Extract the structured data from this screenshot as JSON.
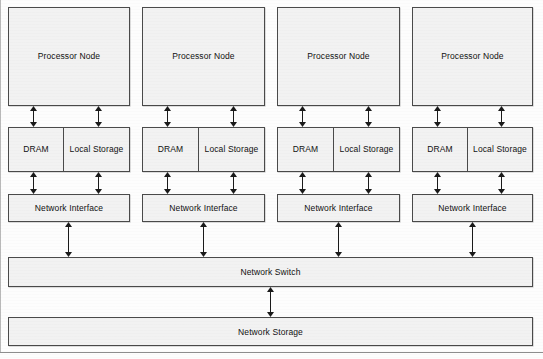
{
  "diagram": {
    "colors": {
      "box_fill": "#f2f2f2",
      "box_border": "#4a4a4a",
      "background": "#fdfdfd",
      "arrow": "#1a1a1a"
    },
    "columns": [
      {
        "id": "node-1",
        "processor_label": "Processor Node",
        "dram_label": "DRAM",
        "local_storage_label": "Local Storage",
        "network_interface_label": "Network Interface"
      },
      {
        "id": "node-2",
        "processor_label": "Processor Node",
        "dram_label": "DRAM",
        "local_storage_label": "Local Storage",
        "network_interface_label": "Network Interface"
      },
      {
        "id": "node-3",
        "processor_label": "Processor Node",
        "dram_label": "DRAM",
        "local_storage_label": "Local Storage",
        "network_interface_label": "Network Interface"
      },
      {
        "id": "node-4",
        "processor_label": "Processor Node",
        "dram_label": "DRAM",
        "local_storage_label": "Local Storage",
        "network_interface_label": "Network Interface"
      }
    ],
    "shared": {
      "network_switch_label": "Network Switch",
      "network_storage_label": "Network Storage"
    },
    "connectors": {
      "kind": "double-headed-arrow",
      "processor_to_memory_count_per_column": 2,
      "memory_to_interface_count_per_column": 2,
      "interface_to_switch_count_per_column": 1,
      "switch_to_storage_count": 1
    }
  }
}
